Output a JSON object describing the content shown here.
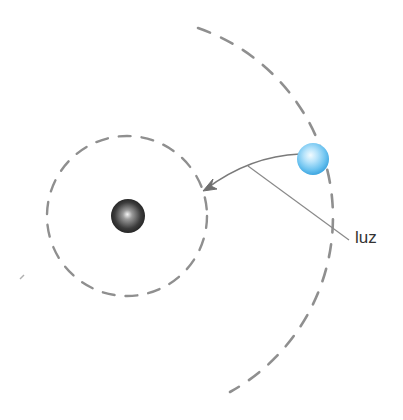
{
  "diagram": {
    "labels": {
      "light": "luz"
    },
    "elements": {
      "nucleus": {
        "description": "dark sphere",
        "color": "#3a3a3a"
      },
      "particle": {
        "description": "light blue sphere",
        "color": "#6ec6f2"
      },
      "inner_orbit": {
        "style": "dashed circle",
        "color": "#888888"
      },
      "outer_orbit": {
        "style": "dashed arc",
        "color": "#888888"
      },
      "trajectory_arrow": {
        "description": "curved arrow from blue sphere toward inner orbit",
        "color": "#777777"
      },
      "label_leader_line": {
        "color": "#8a8a8a"
      }
    }
  }
}
